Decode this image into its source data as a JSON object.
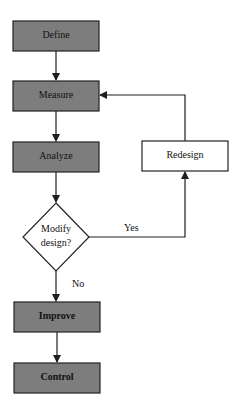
{
  "diagram": {
    "title": "",
    "nodes": [
      {
        "id": "define",
        "label": "Define",
        "shape": "rect",
        "fill": "gray"
      },
      {
        "id": "measure",
        "label": "Measure",
        "shape": "rect",
        "fill": "gray"
      },
      {
        "id": "analyze",
        "label": "Analyze",
        "shape": "rect",
        "fill": "gray"
      },
      {
        "id": "decision",
        "label_line1": "Modify",
        "label_line2": "design?",
        "shape": "diamond",
        "fill": "white"
      },
      {
        "id": "redesign",
        "label": "Redesign",
        "shape": "rect",
        "fill": "white"
      },
      {
        "id": "improve",
        "label": "Improve",
        "shape": "rect",
        "fill": "gray"
      },
      {
        "id": "control",
        "label": "Control",
        "shape": "rect",
        "fill": "gray"
      }
    ],
    "edges": [
      {
        "from": "define",
        "to": "measure",
        "label": ""
      },
      {
        "from": "measure",
        "to": "analyze",
        "label": ""
      },
      {
        "from": "analyze",
        "to": "decision",
        "label": ""
      },
      {
        "from": "decision",
        "to": "redesign",
        "label": "Yes"
      },
      {
        "from": "redesign",
        "to": "measure",
        "label": ""
      },
      {
        "from": "decision",
        "to": "improve",
        "label": "No"
      },
      {
        "from": "improve",
        "to": "control",
        "label": ""
      }
    ],
    "colors": {
      "gray_fill": "#7d7d7d",
      "white_fill": "#ffffff",
      "stroke": "#222222"
    }
  }
}
